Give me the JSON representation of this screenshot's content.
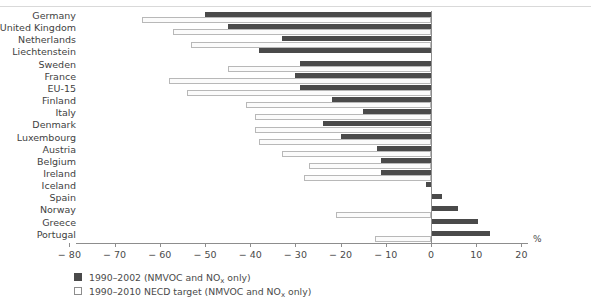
{
  "chart_data": {
    "type": "bar",
    "orientation": "horizontal",
    "title": "",
    "subtitle": "",
    "xlabel": "%",
    "ylabel": "",
    "xlim": [
      -80,
      20
    ],
    "xticks": [
      -80,
      -70,
      -60,
      -50,
      -40,
      -30,
      -20,
      -10,
      0,
      10,
      20
    ],
    "xticklabels": [
      "− 80",
      "− 70",
      "− 60",
      "− 50",
      "− 40",
      "− 30",
      "− 20",
      "− 10",
      "0",
      "10",
      "20"
    ],
    "grid": false,
    "legend_position": "bottom-left",
    "categories": [
      "Germany",
      "United Kingdom",
      "Netherlands",
      "Liechtenstein",
      "Sweden",
      "France",
      "EU-15",
      "Finland",
      "Italy",
      "Denmark",
      "Luxembourg",
      "Austria",
      "Belgium",
      "Ireland",
      "Iceland",
      "Spain",
      "Norway",
      "Greece",
      "Portugal"
    ],
    "series": [
      {
        "name": "1990–2002 (NMVOC and NOₓ only)",
        "color": "#4a4a4a",
        "style": "filled",
        "values": [
          -50,
          -45,
          -33,
          -38,
          -29,
          -30,
          -29,
          -22,
          -15,
          -24,
          -20,
          -12,
          -11,
          -11,
          -1,
          2.5,
          6,
          10.5,
          13
        ]
      },
      {
        "name": "1990–2010 NECD target (NMVOC and NOₓ only)",
        "color": "#ffffff",
        "style": "open",
        "values": [
          -64,
          -57,
          -53,
          null,
          -45,
          -58,
          -54,
          -41,
          -39,
          -39,
          -38,
          -33,
          -27,
          -28,
          null,
          null,
          -21,
          null,
          -12.5
        ]
      }
    ],
    "legend": [
      {
        "swatch": "dark",
        "label_prefix": "1990–2002 (NMVOC and NO",
        "label_sub": "x",
        "label_suffix": " only)"
      },
      {
        "swatch": "open",
        "label_prefix": "1990–2010 NECD target (NMVOC and NO",
        "label_sub": "x",
        "label_suffix": " only)"
      }
    ]
  },
  "axis": {
    "unit": "%"
  }
}
